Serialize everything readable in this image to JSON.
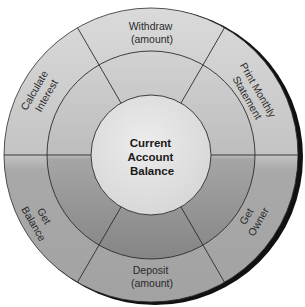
{
  "diagram": {
    "type": "concentric-wheel",
    "center": {
      "lines": [
        "Current",
        "Account",
        "Balance"
      ]
    },
    "segments": [
      {
        "id": "withdraw",
        "lines": [
          "Withdraw",
          "(amount)"
        ]
      },
      {
        "id": "print-monthly-statement",
        "lines": [
          "Print Monthly",
          "Statement"
        ]
      },
      {
        "id": "get-owner",
        "lines": [
          "Get",
          "Owner"
        ]
      },
      {
        "id": "deposit",
        "lines": [
          "Deposit",
          "(amount)"
        ]
      },
      {
        "id": "get-balance",
        "lines": [
          "Get",
          "Balance"
        ]
      },
      {
        "id": "calculate-interest",
        "lines": [
          "Calculate",
          "Interest"
        ]
      }
    ],
    "colors": {
      "center_fill": "#e2e2e2",
      "outer_ring_top": "#d4d4d4",
      "outer_ring_bottom": "#a8a8a8",
      "middle_ring_top": "#cfcfcf",
      "middle_ring_bottom": "#8e8e8e",
      "stroke": "#2b2b2b",
      "shadow": "#111111"
    }
  }
}
